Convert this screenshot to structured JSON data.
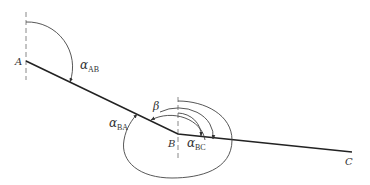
{
  "diagram": {
    "type": "surveying-azimuth-diagram",
    "points": [
      {
        "id": "A",
        "label": "A"
      },
      {
        "id": "B",
        "label": "B"
      },
      {
        "id": "C",
        "label": "C"
      }
    ],
    "angles": {
      "alpha_AB": {
        "symbol": "α",
        "subscript": "AB"
      },
      "alpha_BA": {
        "symbol": "α",
        "subscript": "BA"
      },
      "alpha_BC": {
        "symbol": "α",
        "subscript": "BC"
      },
      "beta": {
        "symbol": "β"
      }
    },
    "colors": {
      "line": "#222222",
      "arc": "#444444",
      "north_line": "#888888",
      "text": "#333333"
    }
  }
}
